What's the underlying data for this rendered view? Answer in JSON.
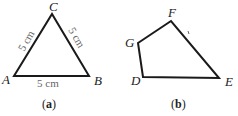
{
  "figure_a": {
    "vertices": {
      "A": "A",
      "B": "B",
      "C": "C"
    },
    "sides": {
      "AC": "5 cm",
      "CB": "5 cm",
      "AB": "5 cm"
    },
    "caption_open": "(",
    "caption_letter": "a",
    "caption_close": ")"
  },
  "figure_b": {
    "vertices": {
      "D": "D",
      "E": "E",
      "F": "F",
      "G": "G"
    },
    "tick": "ʾ",
    "caption_open": "(",
    "caption_letter": "b",
    "caption_close": ")"
  },
  "colors": {
    "stroke": "#1a1a1a",
    "measure": "#666666"
  }
}
